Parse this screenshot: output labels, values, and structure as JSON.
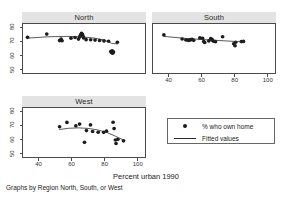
{
  "figure": {
    "xlabel": "Percent urban 1990",
    "note": "Graphs by Region North, South, or West",
    "marker_color": "#1c1c1c",
    "line_color": "#2a2a2a",
    "panel_title_bg": "#e3e3e3",
    "frame_color": "#4a4a4a"
  },
  "legend": {
    "marker_label": "% who own home",
    "line_label": "Fitted values"
  },
  "chart_data": [
    {
      "type": "scatter",
      "title": "North",
      "xlabel": "Percent urban 1990",
      "ylabel": "",
      "xlim": [
        30,
        105
      ],
      "ylim": [
        47,
        83
      ],
      "xticks": [
        40,
        60,
        80,
        100
      ],
      "yticks": [
        50,
        60,
        70,
        80
      ],
      "grid": false,
      "series": [
        {
          "name": "% who own home",
          "kind": "points",
          "points": [
            [
              32.8,
              73.2
            ],
            [
              44.6,
              75.6
            ],
            [
              52.5,
              70.8
            ],
            [
              53.4,
              71.9
            ],
            [
              54.0,
              70.7
            ],
            [
              59.5,
              72.6
            ],
            [
              62.0,
              73.1
            ],
            [
              64.1,
              71.9
            ],
            [
              64.8,
              73.4
            ],
            [
              65.3,
              74.8
            ],
            [
              66.0,
              76.2
            ],
            [
              66.5,
              75.4
            ],
            [
              66.9,
              73.9
            ],
            [
              67.3,
              72.8
            ],
            [
              68.8,
              71.5
            ],
            [
              71.6,
              71.4
            ],
            [
              74.3,
              71.2
            ],
            [
              77.1,
              70.9
            ],
            [
              79.8,
              70.6
            ],
            [
              82.6,
              70.3
            ],
            [
              84.0,
              62.8
            ],
            [
              84.4,
              62.0
            ],
            [
              84.8,
              63.3
            ],
            [
              85.1,
              61.6
            ],
            [
              85.6,
              62.5
            ],
            [
              88.0,
              69.6
            ]
          ]
        },
        {
          "name": "Fitted values",
          "kind": "line",
          "points": [
            [
              32.8,
              72.6
            ],
            [
              45.0,
              73.6
            ],
            [
              57.0,
              73.9
            ],
            [
              66.0,
              73.6
            ],
            [
              74.0,
              72.6
            ],
            [
              80.0,
              71.2
            ],
            [
              84.5,
              68.8
            ],
            [
              88.0,
              68.3
            ]
          ]
        }
      ]
    },
    {
      "type": "scatter",
      "title": "South",
      "xlabel": "Percent urban 1990",
      "ylabel": "",
      "xlim": [
        30,
        105
      ],
      "ylim": [
        47,
        83
      ],
      "xticks": [
        40,
        60,
        80,
        100
      ],
      "yticks": [
        50,
        60,
        70,
        80
      ],
      "grid": false,
      "series": [
        {
          "name": "% who own home",
          "kind": "points",
          "points": [
            [
              36.7,
              75.0
            ],
            [
              47.9,
              72.0
            ],
            [
              50.2,
              71.3
            ],
            [
              51.6,
              71.0
            ],
            [
              52.6,
              71.2
            ],
            [
              53.2,
              71.5
            ],
            [
              54.0,
              71.7
            ],
            [
              55.0,
              71.0
            ],
            [
              58.8,
              72.8
            ],
            [
              60.5,
              72.4
            ],
            [
              61.2,
              70.1
            ],
            [
              61.8,
              69.4
            ],
            [
              64.3,
              70.6
            ],
            [
              65.5,
              72.2
            ],
            [
              66.1,
              71.7
            ],
            [
              66.6,
              71.1
            ],
            [
              67.2,
              70.3
            ],
            [
              68.4,
              70.0
            ],
            [
              72.8,
              73.6
            ],
            [
              79.6,
              68.5
            ],
            [
              80.4,
              67.0
            ],
            [
              80.8,
              69.6
            ],
            [
              84.3,
              70.1
            ],
            [
              85.6,
              70.2
            ]
          ]
        },
        {
          "name": "Fitted values",
          "kind": "line",
          "points": [
            [
              36.7,
              73.9
            ],
            [
              50.0,
              72.4
            ],
            [
              60.0,
              71.6
            ],
            [
              70.0,
              70.9
            ],
            [
              80.0,
              70.2
            ],
            [
              85.6,
              69.8
            ]
          ]
        }
      ]
    },
    {
      "type": "scatter",
      "title": "West",
      "xlabel": "Percent urban 1990",
      "ylabel": "",
      "xlim": [
        30,
        105
      ],
      "ylim": [
        47,
        83
      ],
      "xticks": [
        40,
        60,
        80,
        100
      ],
      "yticks": [
        50,
        60,
        70,
        80
      ],
      "grid": false,
      "series": [
        {
          "name": "% who own home",
          "kind": "points",
          "points": [
            [
              52.5,
              69.2
            ],
            [
              57.0,
              72.4
            ],
            [
              62.5,
              69.9
            ],
            [
              64.8,
              71.2
            ],
            [
              67.8,
              57.8
            ],
            [
              69.0,
              66.4
            ],
            [
              71.5,
              70.6
            ],
            [
              72.8,
              65.7
            ],
            [
              76.2,
              65.2
            ],
            [
              79.6,
              65.1
            ],
            [
              81.3,
              66.0
            ],
            [
              85.4,
              72.5
            ],
            [
              86.0,
              67.9
            ],
            [
              86.8,
              59.5
            ],
            [
              87.2,
              56.9
            ],
            [
              88.3,
              60.0
            ],
            [
              91.8,
              58.9
            ]
          ]
        },
        {
          "name": "Fitted values",
          "kind": "line",
          "points": [
            [
              52.5,
              67.2
            ],
            [
              58.0,
              68.1
            ],
            [
              64.0,
              68.4
            ],
            [
              70.0,
              68.0
            ],
            [
              76.0,
              66.9
            ],
            [
              82.0,
              64.8
            ],
            [
              87.0,
              62.2
            ],
            [
              91.8,
              59.4
            ]
          ]
        }
      ]
    }
  ]
}
